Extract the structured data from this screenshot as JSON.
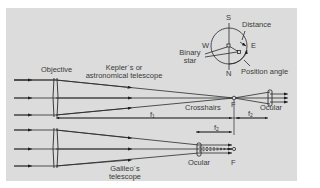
{
  "figure": {
    "compass": {
      "north": "N",
      "south": "S",
      "east": "E",
      "west": "W",
      "distance_label": "Distance",
      "binary_star_label_line1": "Binary",
      "binary_star_label_line2": "star",
      "position_angle_label": "Position angle"
    },
    "kepler": {
      "objective_label": "Objective",
      "title_line1": "Kepler´s or",
      "title_line2": "astronomical telescope",
      "crosshairs_label": "Crosshairs",
      "focus_label": "F",
      "ocular_label": "Ocular",
      "f1_label": "f",
      "f1_sub": "1",
      "f2_label": "f",
      "f2_sub": "2"
    },
    "galileo": {
      "title_line1": "Galileo´s",
      "title_line2": "telescope",
      "ocular_label": "Ocular",
      "focus_label": "F",
      "f2_label": "f",
      "f2_sub": "2"
    },
    "colors": {
      "background": "#dcdcdc",
      "line": "#2a2a2a",
      "text": "#3a3a3a"
    }
  }
}
